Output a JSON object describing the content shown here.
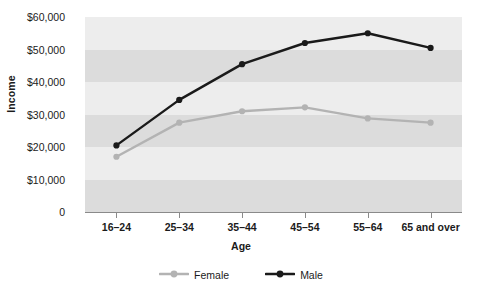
{
  "chart_data": {
    "type": "line",
    "title": "",
    "xlabel": "Age",
    "ylabel": "Income",
    "categories": [
      "16–24",
      "25–34",
      "35–44",
      "45–54",
      "55–64",
      "65 and over"
    ],
    "series": [
      {
        "name": "Female",
        "color": "#b3b3b3",
        "values": [
          17000,
          27500,
          31000,
          32200,
          28800,
          27500
        ]
      },
      {
        "name": "Male",
        "color": "#1a1a1a",
        "values": [
          20500,
          34500,
          45500,
          52000,
          55000,
          50500
        ]
      }
    ],
    "ylim": [
      0,
      60000
    ],
    "ytick_values": [
      0,
      10000,
      20000,
      30000,
      40000,
      50000,
      60000
    ],
    "ytick_labels": [
      "0",
      "$10,000",
      "$20,000",
      "$30,000",
      "$40,000",
      "$50,000",
      "$60,000"
    ],
    "grid": false,
    "banded_background": true,
    "legend_position": "bottom",
    "band_colors": [
      "#ededed",
      "#dcdcdc"
    ]
  },
  "axes": {
    "y_title": "Income",
    "x_title": "Age"
  },
  "legend": {
    "items": [
      {
        "label": "Female",
        "color": "#b3b3b3"
      },
      {
        "label": "Male",
        "color": "#1a1a1a"
      }
    ]
  }
}
